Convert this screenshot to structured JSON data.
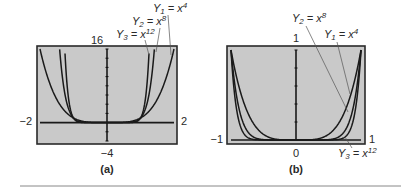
{
  "figure": {
    "rule_color": "#888888",
    "panel_bg": "#c9c9c9",
    "frame_color": "#2a2a2a",
    "curve_color": "#1a1a1a",
    "leader_color": "#555555"
  },
  "chart_data": [
    {
      "type": "line",
      "panel": "(a)",
      "caption": "(a)",
      "xlim": [
        -2,
        2
      ],
      "ylim": [
        -4,
        16
      ],
      "ytick_step": 2,
      "grid": false,
      "tick_labels": {
        "left": "−2",
        "right": "2",
        "top": "16",
        "bottom": "−4"
      },
      "series": [
        {
          "name": "Y1 = x^4",
          "label_var": "Y",
          "label_sub": "1",
          "label_eq": " = x",
          "label_sup": "4",
          "exponent": 4
        },
        {
          "name": "Y2 = x^8",
          "label_var": "Y",
          "label_sub": "2",
          "label_eq": " = x",
          "label_sup": "8",
          "exponent": 8
        },
        {
          "name": "Y3 = x^12",
          "label_var": "Y",
          "label_sub": "3",
          "label_eq": " = x",
          "label_sup": "12",
          "exponent": 12
        }
      ]
    },
    {
      "type": "line",
      "panel": "(b)",
      "caption": "(b)",
      "xlim": [
        -1,
        1
      ],
      "ylim": [
        0,
        1
      ],
      "ytick_step": 0.2,
      "grid": false,
      "tick_labels": {
        "left": "−1",
        "right": "1",
        "top": "1",
        "bottom": "0"
      },
      "series": [
        {
          "name": "Y1 = x^4",
          "label_var": "Y",
          "label_sub": "1",
          "label_eq": " = x",
          "label_sup": "4",
          "exponent": 4
        },
        {
          "name": "Y2 = x^8",
          "label_var": "Y",
          "label_sub": "2",
          "label_eq": " = x",
          "label_sup": "8",
          "exponent": 8
        },
        {
          "name": "Y3 = x^12",
          "label_var": "Y",
          "label_sub": "3",
          "label_eq": " = x",
          "label_sup": "12",
          "exponent": 12
        }
      ]
    }
  ]
}
